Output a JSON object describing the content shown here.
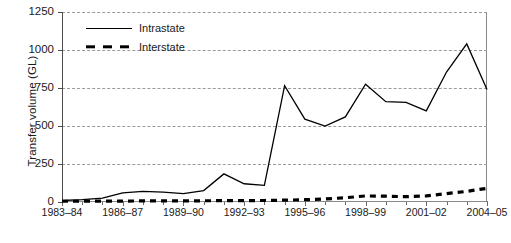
{
  "chart": {
    "type": "line",
    "ylabel": "Transfer volume (GL)",
    "xlabel": "",
    "title": ""
  },
  "legend": {
    "position": "top-left-inside",
    "items": [
      {
        "label": "Intrastate",
        "style": "solid",
        "key": "intrastate-legend-key"
      },
      {
        "label": "Interstate",
        "style": "dashed",
        "key": "interstate-legend-key"
      }
    ]
  },
  "yaxis": {
    "ticks": [
      "0",
      "250",
      "500",
      "750",
      "1000",
      "1250"
    ],
    "min": 0,
    "max": 1250
  },
  "xaxis": {
    "ticks": [
      "1983–84",
      "1986–87",
      "1989–90",
      "1992–93",
      "1995–96",
      "1998–99",
      "2001–02",
      "2004–05"
    ]
  },
  "chart_data": {
    "type": "line",
    "title": "",
    "xlabel": "",
    "ylabel": "Transfer volume (GL)",
    "ylim": [
      0,
      1250
    ],
    "grid": true,
    "legend_position": "top-left-inside",
    "x": [
      "1983–84",
      "1984–85",
      "1985–86",
      "1986–87",
      "1987–88",
      "1988–89",
      "1989–90",
      "1990–91",
      "1991–92",
      "1992–93",
      "1993–94",
      "1994–95",
      "1995–96",
      "1996–97",
      "1997–98",
      "1998–99",
      "1999–00",
      "2000–01",
      "2001–02",
      "2002–03",
      "2003–04",
      "2004–05"
    ],
    "series": [
      {
        "name": "Intrastate",
        "style": "solid",
        "values": [
          10,
          15,
          25,
          60,
          70,
          65,
          55,
          75,
          185,
          120,
          110,
          765,
          545,
          500,
          560,
          775,
          660,
          655,
          600,
          855,
          1040,
          740
        ]
      },
      {
        "name": "Interstate",
        "style": "dashed",
        "values": [
          5,
          5,
          6,
          6,
          7,
          7,
          8,
          8,
          9,
          9,
          10,
          12,
          15,
          20,
          28,
          40,
          38,
          35,
          40,
          55,
          70,
          90
        ]
      }
    ]
  }
}
